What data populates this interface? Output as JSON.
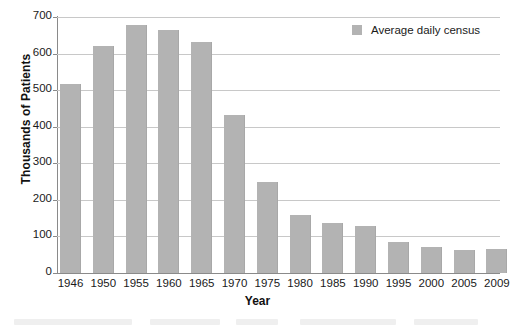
{
  "chart_data": {
    "type": "bar",
    "title": "",
    "xlabel": "Year",
    "ylabel": "Thousands of Patients",
    "categories": [
      "1946",
      "1950",
      "1955",
      "1960",
      "1965",
      "1970",
      "1975",
      "1980",
      "1985",
      "1990",
      "1995",
      "2000",
      "2005",
      "2009"
    ],
    "series": [
      {
        "name": "Average daily census",
        "color": "#b3b3b3",
        "values": [
          518,
          620,
          678,
          665,
          632,
          433,
          248,
          160,
          138,
          128,
          85,
          72,
          63,
          65
        ]
      }
    ],
    "ylim": [
      0,
      700
    ],
    "yticks": [
      0,
      100,
      200,
      300,
      400,
      500,
      600,
      700
    ],
    "ytick_labels": [
      "0",
      "100",
      "200",
      "300",
      "400",
      "500",
      "600",
      "700"
    ],
    "grid": true,
    "legend": {
      "position": "top-right",
      "entries": [
        {
          "label": "Average daily census",
          "swatch": "legend-swatch-icon",
          "color": "#b3b3b3"
        }
      ]
    }
  },
  "axes": {
    "y_title": "Thousands of Patients",
    "x_title": "Year"
  },
  "colors": {
    "bar": "#b3b3b3",
    "grid": "#c8c8c8",
    "axis": "#8a8a8a",
    "text": "#1a1a1a",
    "background": "#ffffff"
  }
}
